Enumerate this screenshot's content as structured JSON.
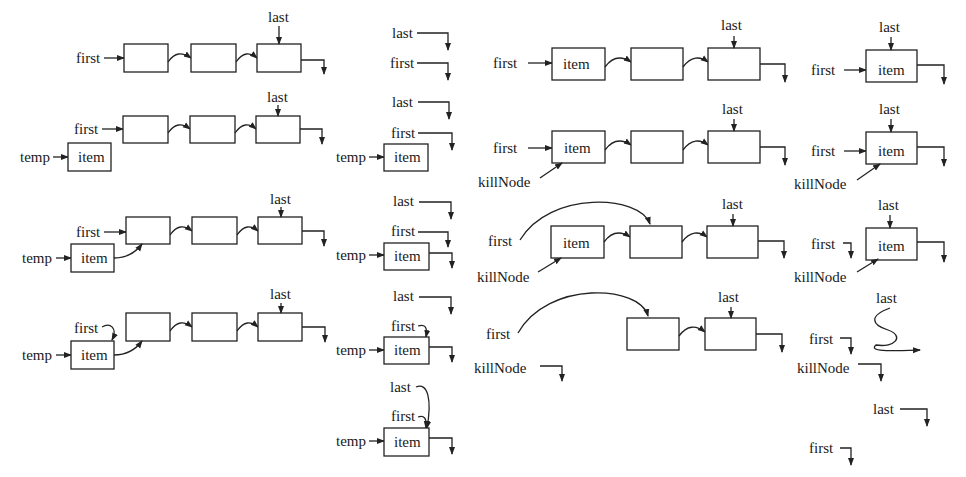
{
  "diagram": {
    "title": "",
    "topic": "linked list insert-at-front and remove-from-front",
    "colors": {
      "ink": "#222222",
      "background": "#ffffff"
    },
    "labels": {
      "first": "first",
      "last": "last",
      "temp": "temp",
      "item": "item",
      "killNode": "killNode"
    },
    "panels": [
      {
        "id": "insert-nonempty",
        "steps": 4,
        "description": "Insert new item at front of non-empty list using temp"
      },
      {
        "id": "insert-empty",
        "steps": 5,
        "description": "Insert new item into empty list using temp"
      },
      {
        "id": "remove-multi",
        "steps": 4,
        "description": "Remove first node from multi-node list using killNode"
      },
      {
        "id": "remove-single",
        "steps": 5,
        "description": "Remove the only node from list using killNode"
      }
    ]
  }
}
